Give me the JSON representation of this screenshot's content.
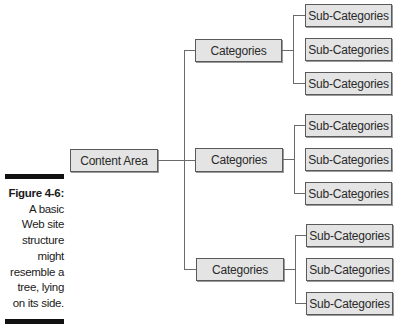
{
  "figure": {
    "label": "Figure 4-6:",
    "caption_lines": [
      "A basic",
      "Web site",
      "structure",
      "might",
      "resemble a",
      "tree, lying",
      "on its side."
    ]
  },
  "tree": {
    "root": {
      "label": "Content Area"
    },
    "categories": [
      {
        "label": "Categories",
        "children": [
          "Sub-Categories",
          "Sub-Categories",
          "Sub-Categories"
        ]
      },
      {
        "label": "Categories",
        "children": [
          "Sub-Categories",
          "Sub-Categories",
          "Sub-Categories"
        ]
      },
      {
        "label": "Categories",
        "children": [
          "Sub-Categories",
          "Sub-Categories",
          "Sub-Categories"
        ]
      }
    ]
  },
  "colors": {
    "box_fill": "#e4e4e4",
    "box_border": "#5a5a5a",
    "connector": "#6a6a6a",
    "caption_bar": "#111111"
  }
}
